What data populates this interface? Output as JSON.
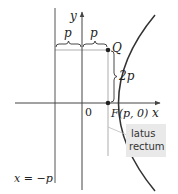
{
  "diagram": {
    "colors": {
      "curve": "#333333",
      "axes": "#444444",
      "guide": "#9a9a9a",
      "callout_bg": "#e9e9e9",
      "text": "#222222"
    },
    "labels": {
      "y_axis": "y",
      "x_axis": "x",
      "origin": "0",
      "focus": "F(p, 0)",
      "point_q": "Q",
      "brace_left": "p",
      "brace_right": "p",
      "brace_vertical": "2p",
      "directrix": "x = −p",
      "callout_line1": "latus",
      "callout_line2": "rectum"
    },
    "geometry": {
      "p_pixels": 26.5,
      "origin": [
        82,
        103
      ],
      "focus": [
        108,
        103
      ],
      "q_point": [
        108,
        50
      ],
      "directrix_x": 55
    }
  }
}
